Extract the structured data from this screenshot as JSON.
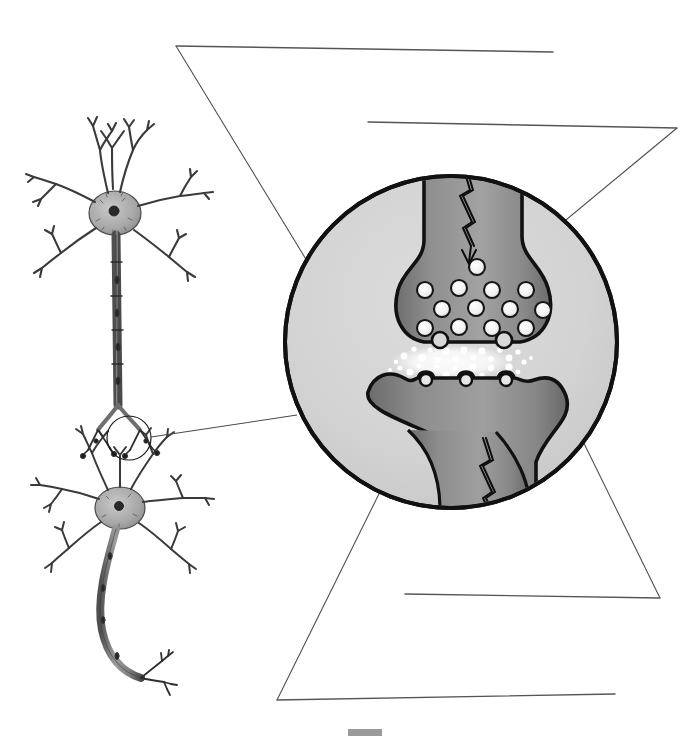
{
  "figure": {
    "title": "Synapse and Neuron Structure Diagram",
    "subtitle": "Unlabeled biology worksheet figure with blank answer lines",
    "background_color": "#ffffff",
    "width": 699,
    "height": 742
  },
  "palette": {
    "ink": "#1a1a1a",
    "leader_line": "#4a4a4a",
    "answer_line": "#555555",
    "circle_fill": "#d2d2d2",
    "circle_stroke": "#111111",
    "neuron_dark": "#8a8a8a",
    "neuron_mid": "#9b9b9b",
    "neuron_shadow": "#6f6f6f",
    "vesicle_fill": "#f2f2f2",
    "vesicle_stroke": "#151515",
    "neurotransmitter": "#ffffff",
    "sketch_gray": "#7d7d7d",
    "sketch_dark": "#2c2c2c",
    "scale_bar": "#9a9a9a"
  },
  "inset_circle": {
    "name": "synapse-magnification-circle",
    "center_x": 451,
    "center_y": 342,
    "radius": 166,
    "stroke_width": 4
  },
  "source_neurons": {
    "upper_neuron": {
      "name": "presynaptic-neuron-sketch",
      "soma_x": 115,
      "soma_y": 213,
      "soma_rx": 26,
      "soma_ry": 22,
      "dendrite_count": 7,
      "axon_end_y": 405
    },
    "lower_neuron": {
      "name": "postsynaptic-neuron-sketch",
      "soma_x": 120,
      "soma_y": 508,
      "soma_rx": 24,
      "soma_ry": 20,
      "dendrite_count": 7,
      "axon_end_y": 680
    },
    "callout_circle": {
      "name": "synapse-region-marker",
      "center_x": 129,
      "center_y": 438,
      "radius": 22
    }
  },
  "answer_blanks": [
    {
      "id": "blank-1",
      "name": "answer-line-presynaptic-axon",
      "value": "",
      "x1": 176,
      "y1": 46,
      "x2": 553,
      "y2": 52,
      "leader_from_x": 176,
      "leader_from_y": 46,
      "leader_to_x": 357,
      "leader_to_y": 343,
      "target": "synaptic cleft / neurotransmitter region"
    },
    {
      "id": "blank-2",
      "name": "answer-line-synaptic-knob",
      "value": "",
      "x1": 368,
      "y1": 122,
      "x2": 677,
      "y2": 128,
      "leader_from_x": 677,
      "leader_from_y": 128,
      "leader_to_x": 520,
      "leader_to_y": 258,
      "target": "presynaptic terminal / synaptic knob"
    },
    {
      "id": "blank-3",
      "name": "answer-line-postsynaptic-receptors",
      "value": "",
      "x1": 405,
      "y1": 594,
      "x2": 660,
      "y2": 598,
      "leader_from_x": 660,
      "leader_from_y": 598,
      "leader_to_x": 543,
      "leader_to_y": 360,
      "target": "postsynaptic membrane receptors"
    },
    {
      "id": "blank-4",
      "name": "answer-line-postsynaptic-dendrite",
      "value": "",
      "x1": 277,
      "y1": 700,
      "x2": 615,
      "y2": 694,
      "leader_from_x": 277,
      "leader_from_y": 700,
      "leader_to_x": 418,
      "leader_to_y": 415,
      "target": "postsynaptic neuron dendrite"
    }
  ],
  "leader_lines": [
    {
      "name": "leader-line-1",
      "points": "176,46 357,343"
    },
    {
      "name": "leader-line-2",
      "points": "677,128 520,258"
    },
    {
      "name": "leader-line-3",
      "points": "660,598 543,360"
    },
    {
      "name": "leader-line-4",
      "points": "277,700 418,415"
    },
    {
      "name": "leader-line-callout",
      "points": "151,437 297,415"
    }
  ],
  "synapse_detail": {
    "presynaptic_terminal": {
      "name": "presynaptic-terminal",
      "label": "axon terminal (synaptic knob)"
    },
    "postsynaptic_terminal": {
      "name": "postsynaptic-terminal",
      "label": "postsynaptic dendrite"
    },
    "vesicles": {
      "name": "synaptic-vesicle",
      "count": 13,
      "radius": 8,
      "positions": [
        [
          425,
          290
        ],
        [
          459,
          288
        ],
        [
          492,
          290
        ],
        [
          526,
          290
        ],
        [
          442,
          309
        ],
        [
          476,
          308
        ],
        [
          510,
          309
        ],
        [
          425,
          328
        ],
        [
          459,
          327
        ],
        [
          492,
          328
        ],
        [
          526,
          328
        ],
        [
          477,
          267
        ],
        [
          543,
          310
        ]
      ]
    },
    "neurotransmitters": {
      "name": "neurotransmitter-particle",
      "count": 46,
      "cleft_y_top": 348,
      "cleft_y_bottom": 378
    },
    "receptor_sites": {
      "name": "receptor-site",
      "count": 3,
      "positions_x": [
        420,
        460,
        500
      ],
      "y": 382
    },
    "release_sites": {
      "name": "vesicle-release-site",
      "count": 2,
      "positions_x": [
        432,
        498
      ],
      "y": 344
    },
    "impulse_arrows": [
      {
        "name": "impulse-arrow-presynaptic",
        "direction": "down",
        "x": 467,
        "y_start": 166,
        "y_end": 252
      },
      {
        "name": "impulse-arrow-postsynaptic",
        "direction": "down",
        "x": 487,
        "y_start": 440,
        "y_end": 522
      }
    ]
  },
  "scale_bar": {
    "name": "scale-bar",
    "x": 348,
    "y": 729,
    "width": 34,
    "height": 7,
    "label": ""
  }
}
